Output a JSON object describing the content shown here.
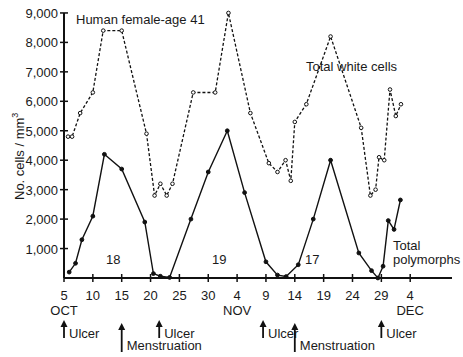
{
  "chart_data": {
    "type": "line",
    "title": "Human female-age 41",
    "xlabel": "",
    "ylabel": "No. cells / mm³",
    "ylim": [
      0,
      9000
    ],
    "grid": false,
    "y_ticks": [
      "1,000",
      "2,000",
      "3,000",
      "4,000",
      "5,000",
      "6,000",
      "7,000",
      "8,000",
      "9,000"
    ],
    "x_ticks": [
      {
        "label": "5",
        "month": "OCT"
      },
      {
        "label": "10",
        "month": ""
      },
      {
        "label": "15",
        "month": ""
      },
      {
        "label": "20",
        "month": ""
      },
      {
        "label": "25",
        "month": ""
      },
      {
        "label": "30",
        "month": ""
      },
      {
        "label": "4",
        "month": "NOV"
      },
      {
        "label": "9",
        "month": ""
      },
      {
        "label": "14",
        "month": ""
      },
      {
        "label": "19",
        "month": ""
      },
      {
        "label": "24",
        "month": ""
      },
      {
        "label": "29",
        "month": ""
      },
      {
        "label": "4",
        "month": "DEC"
      }
    ],
    "series": [
      {
        "name": "Total white cells",
        "style": "dashed",
        "points": [
          {
            "day": 5.7,
            "value": 4800
          },
          {
            "day": 6.4,
            "value": 4800
          },
          {
            "day": 7.8,
            "value": 5600
          },
          {
            "day": 10,
            "value": 6300
          },
          {
            "day": 11.8,
            "value": 8400
          },
          {
            "day": 15,
            "value": 8400
          },
          {
            "day": 19.3,
            "value": 4900
          },
          {
            "day": 20.7,
            "value": 2800
          },
          {
            "day": 21.7,
            "value": 3200
          },
          {
            "day": 22.8,
            "value": 2800
          },
          {
            "day": 23.8,
            "value": 3200
          },
          {
            "day": 27.4,
            "value": 6300
          },
          {
            "day": 31.2,
            "value": 6300
          },
          {
            "day": 33.5,
            "value": 9000
          },
          {
            "day": 37.3,
            "value": 5600
          },
          {
            "day": 40.5,
            "value": 3900
          },
          {
            "day": 42,
            "value": 3600
          },
          {
            "day": 43.4,
            "value": 4000
          },
          {
            "day": 44.3,
            "value": 3300
          },
          {
            "day": 45,
            "value": 5300
          },
          {
            "day": 47,
            "value": 5900
          },
          {
            "day": 51.2,
            "value": 8200
          },
          {
            "day": 56.5,
            "value": 5100
          },
          {
            "day": 58.1,
            "value": 2800
          },
          {
            "day": 59,
            "value": 3000
          },
          {
            "day": 59.6,
            "value": 4100
          },
          {
            "day": 60.5,
            "value": 4000
          },
          {
            "day": 61.5,
            "value": 6400
          },
          {
            "day": 62.5,
            "value": 5500
          },
          {
            "day": 63.4,
            "value": 5900
          }
        ]
      },
      {
        "name": "Total polymorphs",
        "style": "solid",
        "points": [
          {
            "day": 5.9,
            "value": 200
          },
          {
            "day": 7,
            "value": 500
          },
          {
            "day": 8.1,
            "value": 1300
          },
          {
            "day": 10,
            "value": 2100
          },
          {
            "day": 12,
            "value": 4200
          },
          {
            "day": 15,
            "value": 3700
          },
          {
            "day": 19,
            "value": 1900
          },
          {
            "day": 20.5,
            "value": 150
          },
          {
            "day": 21.7,
            "value": 60
          },
          {
            "day": 23.3,
            "value": 20
          },
          {
            "day": 27,
            "value": 2000
          },
          {
            "day": 30,
            "value": 3600
          },
          {
            "day": 33.3,
            "value": 5000
          },
          {
            "day": 36.3,
            "value": 2900
          },
          {
            "day": 40,
            "value": 550
          },
          {
            "day": 42,
            "value": 100
          },
          {
            "day": 43.5,
            "value": 50
          },
          {
            "day": 45.6,
            "value": 450
          },
          {
            "day": 48.2,
            "value": 2000
          },
          {
            "day": 51.2,
            "value": 4000
          },
          {
            "day": 56.1,
            "value": 850
          },
          {
            "day": 58.3,
            "value": 250
          },
          {
            "day": 59.4,
            "value": 0
          },
          {
            "day": 60.3,
            "value": 400
          },
          {
            "day": 61.2,
            "value": 1950
          },
          {
            "day": 62.2,
            "value": 1650
          },
          {
            "day": 63.3,
            "value": 2650
          }
        ]
      }
    ],
    "annotations": [
      {
        "text": "18",
        "day": 14,
        "value": 1000
      },
      {
        "text": "19",
        "day": 31.5,
        "value": 1000
      },
      {
        "text": "17",
        "day": 47.5,
        "value": 1000
      },
      {
        "text": "Total white cells",
        "day": 48.5,
        "value": 6600
      },
      {
        "text": "Total polymorphs",
        "day": 61.8,
        "value": 1000
      }
    ],
    "events": [
      {
        "label": "Ulcer",
        "day": 5
      },
      {
        "label": "Menstruation",
        "day": 15
      },
      {
        "label": "Ulcer",
        "day": 21.5
      },
      {
        "label": "Ulcer",
        "day": 39.5
      },
      {
        "label": "Menstruation",
        "day": 45
      },
      {
        "label": "Ulcer",
        "day": 60
      }
    ]
  },
  "labels": {
    "title": "Human female-age 41",
    "ylabel": "No. cells / mm",
    "ylabel_sup": "3",
    "white_cells": "Total white cells",
    "polymorphs_1": "Total",
    "polymorphs_2": "polymorphs",
    "cycle_18": "18",
    "cycle_19": "19",
    "cycle_17": "17"
  }
}
